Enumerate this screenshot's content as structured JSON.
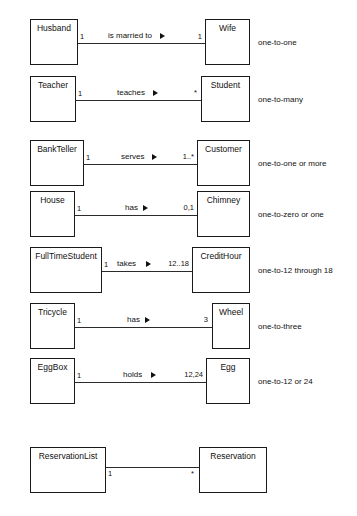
{
  "diagram": {
    "rows": [
      {
        "id": "husband-wife",
        "source": {
          "name": "Husband",
          "multiplicity": "1"
        },
        "target": {
          "name": "Wife",
          "multiplicity": "1"
        },
        "verb": "is married to",
        "direction_marker": "filled-right-triangle",
        "caption": "one-to-one"
      },
      {
        "id": "teacher-student",
        "source": {
          "name": "Teacher",
          "multiplicity": "1"
        },
        "target": {
          "name": "Student",
          "multiplicity": "*"
        },
        "verb": "teaches",
        "direction_marker": "filled-right-triangle",
        "caption": "one-to-many"
      },
      {
        "id": "bankteller-customer",
        "source": {
          "name": "BankTeller",
          "multiplicity": "1"
        },
        "target": {
          "name": "Customer",
          "multiplicity": "1..*"
        },
        "verb": "serves",
        "direction_marker": "filled-right-triangle",
        "caption": "one-to-one or more"
      },
      {
        "id": "house-chimney",
        "source": {
          "name": "House",
          "multiplicity": "1"
        },
        "target": {
          "name": "Chimney",
          "multiplicity": "0,1"
        },
        "verb": "has",
        "direction_marker": "filled-right-triangle",
        "caption": "one-to-zero or one"
      },
      {
        "id": "fulltimestudent-credithour",
        "source": {
          "name": "FullTimeStudent",
          "multiplicity": "1"
        },
        "target": {
          "name": "CreditHour",
          "multiplicity": "12..18"
        },
        "verb": "takes",
        "direction_marker": "filled-right-triangle",
        "caption": "one-to-12 through 18"
      },
      {
        "id": "tricycle-wheel",
        "source": {
          "name": "Tricycle",
          "multiplicity": "1"
        },
        "target": {
          "name": "Wheel",
          "multiplicity": "3"
        },
        "verb": "has",
        "direction_marker": "filled-right-triangle",
        "caption": "one-to-three"
      },
      {
        "id": "eggbox-egg",
        "source": {
          "name": "EggBox",
          "multiplicity": "1"
        },
        "target": {
          "name": "Egg",
          "multiplicity": "12,24"
        },
        "verb": "holds",
        "direction_marker": "filled-right-triangle",
        "caption": "one-to-12 or 24"
      },
      {
        "id": "reservationlist-reservation",
        "source": {
          "name": "ReservationList",
          "multiplicity": "1"
        },
        "target": {
          "name": "Reservation",
          "multiplicity": "*"
        },
        "verb": "",
        "direction_marker": "none",
        "caption": ""
      }
    ],
    "colors": {
      "background": "#ffffff",
      "box_border": "#1a1a1a",
      "line": "#2b2b2b",
      "text": "#111111"
    }
  }
}
